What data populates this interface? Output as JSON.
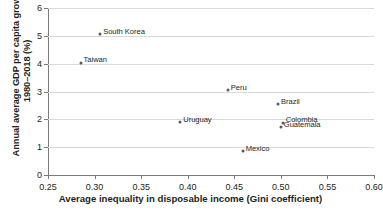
{
  "chart_data": {
    "type": "scatter",
    "title": "",
    "xlabel": "Average inequality in disposable income (Gini coefficient)",
    "ylabel_line1": "Annual average GDP per capita growth,",
    "ylabel_line2": "1980–2018 (%)",
    "xlim": [
      0.25,
      0.6
    ],
    "ylim": [
      0,
      6
    ],
    "xticks": [
      "0.25",
      "0.30",
      "0.35",
      "0.40",
      "0.45",
      "0.50",
      "0.55",
      "0.60"
    ],
    "xtick_values": [
      0.25,
      0.3,
      0.35,
      0.4,
      0.45,
      0.5,
      0.55,
      0.6
    ],
    "yticks": [
      "0",
      "1",
      "2",
      "3",
      "4",
      "5",
      "6"
    ],
    "ytick_values": [
      0,
      1,
      2,
      3,
      4,
      5,
      6
    ],
    "grid": "horizontal",
    "legend": "none",
    "marker_color": "#58595b",
    "grid_color": "#d9d9d9",
    "axis_color": "#7a7a7a",
    "points": [
      {
        "label": "South Korea",
        "x": 0.306,
        "y": 5.05,
        "label_pos": "right"
      },
      {
        "label": "Taiwan",
        "x": 0.285,
        "y": 4.03,
        "label_pos": "right"
      },
      {
        "label": "Peru",
        "x": 0.443,
        "y": 3.05,
        "label_pos": "right"
      },
      {
        "label": "Brazil",
        "x": 0.497,
        "y": 2.55,
        "label_pos": "right"
      },
      {
        "label": "Uruguay",
        "x": 0.392,
        "y": 1.9,
        "label_pos": "right"
      },
      {
        "label": "Colombia",
        "x": 0.502,
        "y": 1.88,
        "label_pos": "right"
      },
      {
        "label": "Guatemala",
        "x": 0.5,
        "y": 1.72,
        "label_pos": "right"
      },
      {
        "label": "Mexico",
        "x": 0.459,
        "y": 0.85,
        "label_pos": "right"
      }
    ]
  }
}
